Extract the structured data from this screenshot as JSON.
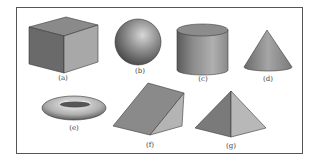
{
  "figure": {
    "border_color": "#555555",
    "shapes": [
      {
        "id": "a",
        "name": "cube",
        "label": "(a)"
      },
      {
        "id": "b",
        "name": "sphere",
        "label": "(b)"
      },
      {
        "id": "c",
        "name": "cylinder",
        "label": "(c)"
      },
      {
        "id": "d",
        "name": "cone",
        "label": "(d)"
      },
      {
        "id": "e",
        "name": "torus",
        "label": "(e)"
      },
      {
        "id": "f",
        "name": "wedge",
        "label": "(f)"
      },
      {
        "id": "g",
        "name": "pyramid",
        "label": "(g)"
      }
    ]
  }
}
